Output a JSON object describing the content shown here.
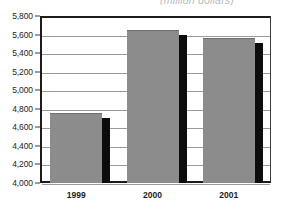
{
  "chart_data": {
    "type": "bar",
    "title": "(million dollars)",
    "title_note": "partially cropped at top of image",
    "xlabel": "",
    "ylabel": "",
    "categories": [
      "1999",
      "2000",
      "2001"
    ],
    "values": [
      4750,
      5650,
      5560
    ],
    "series": [
      {
        "name": "Value",
        "values": [
          4750,
          5650,
          5560
        ]
      }
    ],
    "ylim": [
      4000,
      5800
    ],
    "ytick_step": 200,
    "ytick_labels": [
      "5,800",
      "5,600",
      "5,400",
      "5,200",
      "5,000",
      "4,800",
      "4,600",
      "4,400",
      "4,200",
      "4,000"
    ],
    "ytick_values": [
      5800,
      5600,
      5400,
      5200,
      5000,
      4800,
      4600,
      4400,
      4200,
      4000
    ],
    "grid": true,
    "grid_axis": "y",
    "legend": false,
    "legend_position": "none",
    "orientation": "vertical"
  },
  "style": {
    "bar_fill": "#8c8c8c",
    "bar_shadow": "#0d0d0d",
    "gridline_color": "#9a9a9a",
    "axis_color": "#1c1c1c",
    "background": "#ffffff",
    "title_color": "#b9b9b9"
  }
}
